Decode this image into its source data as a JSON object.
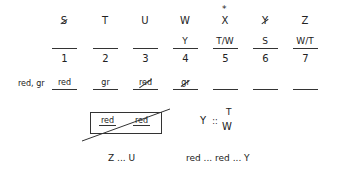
{
  "slots": [
    {
      "number": "1",
      "top": "S",
      "top_struck": true,
      "fill": "",
      "bottom": "red",
      "bottom_struck": false
    },
    {
      "number": "2",
      "top": "T",
      "top_struck": false,
      "fill": "",
      "bottom": "gr",
      "bottom_struck": false
    },
    {
      "number": "3",
      "top": "U",
      "top_struck": false,
      "fill": "",
      "bottom": "red",
      "bottom_struck": true
    },
    {
      "number": "4",
      "top": "W",
      "top_struck": false,
      "fill": "Y",
      "bottom": "gr",
      "bottom_struck": true
    },
    {
      "number": "5",
      "top": "X",
      "top_struck": false,
      "star": "*",
      "fill": "T/W",
      "bottom": "",
      "bottom_struck": false
    },
    {
      "number": "6",
      "top": "Y",
      "top_struck": true,
      "fill": "S",
      "bottom": "",
      "bottom_struck": false
    },
    {
      "number": "7",
      "top": "Z",
      "top_struck": false,
      "fill": "W/T",
      "bottom": "",
      "bottom_struck": false
    }
  ],
  "row_label": "red, gr",
  "boxed": {
    "left": "red",
    "right": "red"
  },
  "rule": {
    "left": "Y",
    "sep": "::",
    "top": "T",
    "bottom": "W"
  },
  "sequence_1": "Z ... U",
  "sequence_2": "red ... red ... Y"
}
